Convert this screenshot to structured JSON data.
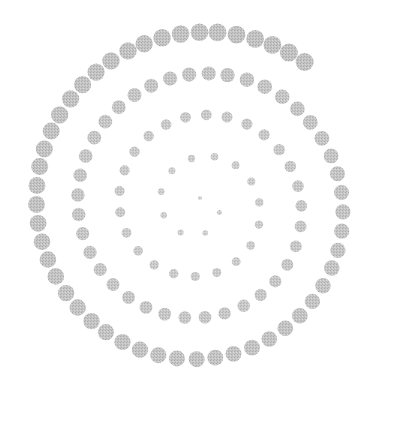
{
  "image": {
    "width": 412,
    "height": 435,
    "background": "#ffffff",
    "description": "Spiral of stippled gray dots winding outward from the center"
  },
  "spiral": {
    "center": [
      200,
      206
    ],
    "dot_color": "#b8b8b8",
    "dot_color_light": "#d2d2d2",
    "turns": 4.1,
    "start_radius": 8,
    "end_radius": 178,
    "start_angle_deg": -90,
    "dot_count": 120,
    "min_dot_diameter": 4,
    "max_dot_diameter": 18
  }
}
